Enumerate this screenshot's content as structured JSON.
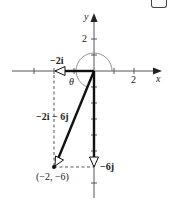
{
  "axes": {
    "x_label": "x",
    "y_label": "y",
    "x_tick_label": "2",
    "y_tick_label": "2"
  },
  "angle_label": "θ",
  "vectors": {
    "horizontal": {
      "label": "−2i",
      "components": [
        -2,
        0
      ]
    },
    "vertical": {
      "label": "−6j",
      "components": [
        0,
        -6
      ]
    },
    "resultant": {
      "label": "−2i − 6j",
      "components": [
        -2,
        -6
      ]
    }
  },
  "point": {
    "label": "(−2, −6)",
    "coords": [
      -2,
      -6
    ]
  },
  "colors": {
    "axis": "#555555",
    "vector": "#111111",
    "dashed": "#555555",
    "arc": "#888888"
  }
}
